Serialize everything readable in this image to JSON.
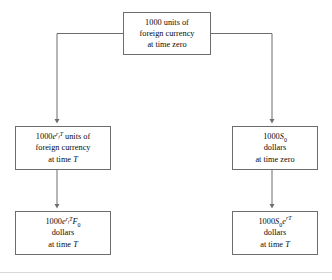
{
  "diagram": {
    "type": "flowchart",
    "background": "#ffffff",
    "line_color": "#6d6d6d",
    "border_color": "#6d6d6d",
    "text_color": "#0a0a0a",
    "nodes": [
      {
        "id": "top",
        "name": "initial-foreign-currency",
        "lines": [
          "1000 units of",
          "foreign currency",
          "at time zero"
        ],
        "amount": "1000",
        "unit": "units of foreign currency",
        "time": "zero"
      },
      {
        "id": "foreign-grown",
        "name": "foreign-currency-at-time-T",
        "math_prefix": "1000",
        "math_base": "e",
        "math_exp_rate": "r",
        "math_exp_sub": "f",
        "math_exp_time": "T",
        "math_suffix": " units of",
        "lines": [
          "foreign currency",
          "at time "
        ],
        "time_symbol": "T",
        "plain": "1000e^(r_f T) units of foreign currency at time T"
      },
      {
        "id": "spot-dollars",
        "name": "dollars-at-time-zero",
        "math_prefix": "1000",
        "math_symbol": "S",
        "math_sub": "0",
        "lines": [
          "dollars",
          "at time zero"
        ],
        "plain": "1000S_0 dollars at time zero"
      },
      {
        "id": "forward-dollars",
        "name": "forward-converted-dollars",
        "math_prefix": "1000",
        "math_base": "e",
        "math_exp_rate": "r",
        "math_exp_sub": "f",
        "math_exp_time": "T",
        "math_symbol": "F",
        "math_sub": "0",
        "lines": [
          "dollars",
          "at time "
        ],
        "time_symbol": "T",
        "plain": "1000e^(r_f T) F_0 dollars at time T"
      },
      {
        "id": "invested-dollars",
        "name": "domestically-invested-dollars",
        "math_prefix": "1000",
        "math_symbol": "S",
        "math_sub": "0",
        "math_base": "e",
        "math_exp_rate": "r",
        "math_exp_time": "T",
        "lines": [
          "dollars",
          "at time "
        ],
        "time_symbol": "T",
        "plain": "1000S_0 e^(rT) dollars at time T"
      }
    ],
    "edges": [
      {
        "name": "branch-left",
        "from": "top",
        "to": "foreign-grown",
        "style": "elbow-left-then-down",
        "arrowhead": "solid-triangle"
      },
      {
        "name": "branch-right",
        "from": "top",
        "to": "spot-dollars",
        "style": "elbow-right-then-down",
        "arrowhead": "solid-triangle"
      },
      {
        "name": "left-down",
        "from": "foreign-grown",
        "to": "forward-dollars",
        "style": "straight-down",
        "arrowhead": "solid-triangle"
      },
      {
        "name": "right-down",
        "from": "spot-dollars",
        "to": "invested-dollars",
        "style": "straight-down",
        "arrowhead": "solid-triangle"
      }
    ]
  }
}
